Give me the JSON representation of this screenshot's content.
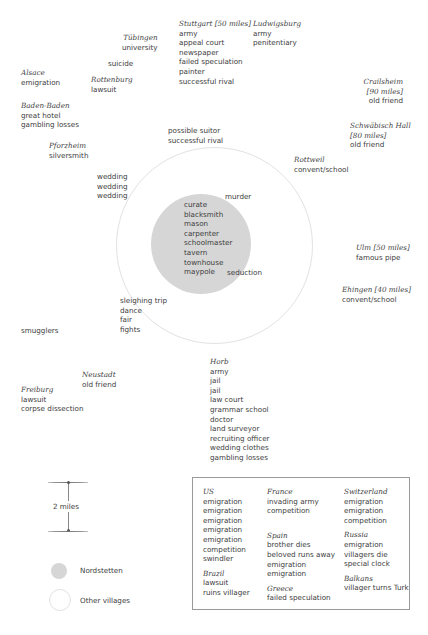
{
  "diagram": {
    "center_village": {
      "name": "Nordstetten",
      "items": [
        "curate",
        "blacksmith",
        "mason",
        "carpenter",
        "schoolmaster",
        "tavern",
        "townhouse",
        "maypole"
      ]
    },
    "ring_events": {
      "murder": "murder",
      "seduction": "seduction",
      "possible_suitor": [
        "possible suitor",
        "successful rival"
      ],
      "weddings": [
        "wedding",
        "wedding",
        "wedding"
      ],
      "sleighing": [
        "sleighing trip",
        "dance",
        "fair",
        "fights"
      ]
    },
    "places": {
      "tubingen": {
        "name": "Tübingen",
        "events": [
          "university"
        ]
      },
      "suicide": {
        "events": [
          "suicide"
        ]
      },
      "stuttgart": {
        "name": "Stuttgart [50 miles]",
        "events": [
          "army",
          "appeal court",
          "newspaper",
          "failed speculation",
          "painter",
          "successful rival"
        ]
      },
      "ludwigsburg": {
        "name": "Ludwigsburg",
        "events": [
          "army",
          "penitentiary"
        ]
      },
      "alsace": {
        "name": "Alsace",
        "events": [
          "emigration"
        ]
      },
      "rottenburg": {
        "name": "Rottenburg",
        "events": [
          "lawsuit"
        ]
      },
      "baden_baden": {
        "name": "Baden-Baden",
        "events": [
          "great hotel",
          "gambling losses"
        ]
      },
      "crailsheim": {
        "name_lines": [
          "Crailsheim",
          "[90 miles]"
        ],
        "events": [
          "old friend"
        ]
      },
      "schwabisch_hall": {
        "name_lines": [
          "Schwäbisch Hall",
          "[80 miles]"
        ],
        "events": [
          "old friend"
        ]
      },
      "pforzheim": {
        "name": "Pforzheim",
        "events": [
          "silversmith"
        ]
      },
      "rottweil": {
        "name": "Rottweil",
        "events": [
          "convent/school"
        ]
      },
      "ulm": {
        "name": "Ulm [50 miles]",
        "events": [
          "famous pipe"
        ]
      },
      "ehingen": {
        "name": "Ehingen [40 miles]",
        "events": [
          "convent/school"
        ]
      },
      "smugglers": {
        "events": [
          "smugglers"
        ]
      },
      "neustadt": {
        "name": "Neustadt",
        "events": [
          "old friend"
        ]
      },
      "freiburg": {
        "name": "Freiburg",
        "events": [
          "lawsuit",
          "corpse dissection"
        ]
      },
      "horb": {
        "name": "Horb",
        "events": [
          "army",
          "jail",
          "jail",
          "law court",
          "grammar school",
          "doctor",
          "land surveyor",
          "recruiting officer",
          "wedding clothes",
          "gambling losses"
        ]
      }
    }
  },
  "legend": {
    "scale_label": "2 miles",
    "nordstetten_label": "Nordstetten",
    "other_villages_label": "Other villages",
    "colors": {
      "nordstetten_fill": "#d6d6d6",
      "other_villages_stroke": "#e2e2e2"
    }
  },
  "abroad": {
    "columns": [
      [
        {
          "country": "US",
          "events": [
            "emigration",
            "emigration",
            "emigration",
            "emigration",
            "emigration",
            "competition",
            "swindler"
          ]
        },
        {
          "country": "Brazil",
          "events": [
            "lawsuit",
            "ruins villager"
          ]
        }
      ],
      [
        {
          "country": "France",
          "events": [
            "invading army",
            "competition"
          ]
        },
        {
          "country": "Spain",
          "events": [
            "brother dies",
            "beloved runs away",
            "emigration",
            "emigration"
          ]
        },
        {
          "country": "Greece",
          "events": [
            "failed speculation"
          ]
        }
      ],
      [
        {
          "country": "Switzerland",
          "events": [
            "emigration",
            "emigration",
            "competition"
          ]
        },
        {
          "country": "Russia",
          "events": [
            "emigration",
            "villagers die",
            "special clock"
          ]
        },
        {
          "country": "Balkans",
          "events": [
            "villager turns Turk"
          ]
        }
      ]
    ]
  }
}
